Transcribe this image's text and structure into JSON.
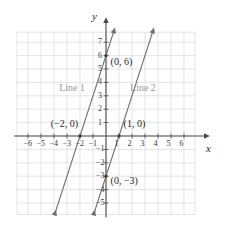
{
  "chart_data": {
    "type": "line",
    "title": "",
    "xlabel": "x",
    "ylabel": "y",
    "xlim": [
      -6.8,
      6.8
    ],
    "ylim": [
      -5.8,
      7.8
    ],
    "grid": true,
    "legend": "inline-labels",
    "x_ticks": [
      -6,
      -5,
      -4,
      -3,
      -2,
      -1,
      1,
      2,
      3,
      4,
      5,
      6
    ],
    "x_tick_labels": [
      "−6",
      "−5",
      "−4",
      "−3",
      "−2",
      "−1",
      "1",
      "2",
      "3",
      "4",
      "5",
      "6"
    ],
    "y_ticks": [
      7,
      6,
      5,
      4,
      3,
      2,
      1,
      -1,
      -2,
      -3,
      -4,
      -5
    ],
    "y_tick_labels": [
      "7",
      "6",
      "5",
      "4",
      "3",
      "2",
      "1",
      "−1",
      "−2",
      "−3",
      "−4",
      "−5"
    ],
    "series": [
      {
        "name": "Line 1",
        "label": "Line 1",
        "slope": 3,
        "intercept": 6,
        "x_intercept": -2,
        "y_intercept": 6,
        "color": "#6f6f6f",
        "label_x": -3.6,
        "label_y": 3.55
      },
      {
        "name": "Line 2",
        "label": "Line 2",
        "slope": 3,
        "intercept": -3,
        "x_intercept": 1,
        "y_intercept": -3,
        "color": "#6f6f6f",
        "label_x": 1.85,
        "label_y": 3.55
      }
    ],
    "annotations": [
      {
        "text": "(0, 6)",
        "x": 0,
        "y": 6,
        "label_x": 0.35,
        "label_y": 5.55
      },
      {
        "text": "(−2, 0)",
        "x": -2,
        "y": 0,
        "label_x": -4.25,
        "label_y": 0.92
      },
      {
        "text": "(1, 0)",
        "x": 1,
        "y": 0,
        "label_x": 1.35,
        "label_y": 0.92
      },
      {
        "text": "(0, −3)",
        "x": 0,
        "y": -3,
        "label_x": 0.35,
        "label_y": -3.35
      }
    ],
    "axis_label_x": "x",
    "axis_label_y": "y",
    "colors": {
      "grid": "#d9d9de",
      "axis": "#4a4a4a",
      "line": "#6f6f6f",
      "point": "#3a3a3a",
      "label_line": "#9a9a9a",
      "background": "#ffffff"
    }
  }
}
